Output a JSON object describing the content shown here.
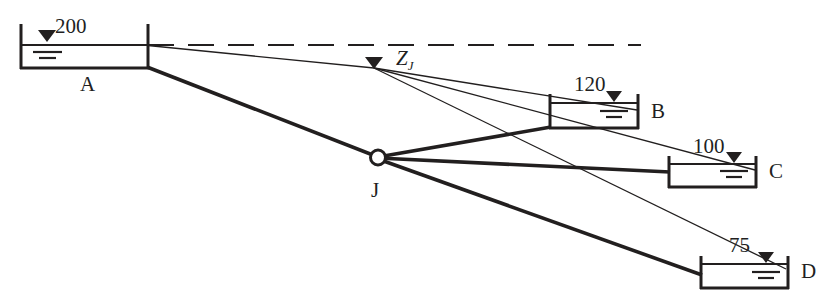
{
  "diagram": {
    "type": "hydraulic-schematic",
    "colors": {
      "line": "#221f1f",
      "background": "#ffffff",
      "water_symbol": "#221f1f"
    },
    "junction": {
      "label": "J",
      "head_label": "Z",
      "head_subscript": "J",
      "head_label_full": "ZJ"
    },
    "reservoirs": [
      {
        "id": "A",
        "name": "A",
        "level": "200",
        "name_position": "below"
      },
      {
        "id": "B",
        "name": "B",
        "level": "120",
        "name_position": "right"
      },
      {
        "id": "C",
        "name": "C",
        "level": "100",
        "name_position": "right"
      },
      {
        "id": "D",
        "name": "D",
        "level": "75",
        "name_position": "right"
      }
    ],
    "elements": {
      "datum_line": "dashed-horizontal-hydraulic-grade-reference",
      "pipes": [
        {
          "from": "A",
          "to": "J"
        },
        {
          "from": "J",
          "to": "B"
        },
        {
          "from": "J",
          "to": "C"
        },
        {
          "from": "J",
          "to": "D"
        }
      ],
      "piezometric_lines": [
        {
          "from": "A",
          "to": "ZJ"
        },
        {
          "from": "ZJ",
          "to": "B"
        },
        {
          "from": "ZJ",
          "to": "C"
        },
        {
          "from": "ZJ",
          "to": "D"
        }
      ]
    }
  }
}
